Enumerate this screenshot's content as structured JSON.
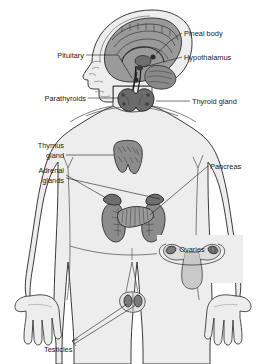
{
  "figure": {
    "title_partial": "",
    "width": 265,
    "height": 364
  },
  "colors": {
    "body_fill": "#ededed",
    "body_stroke": "#3a3a3a",
    "gland_fill": "#8c8c8c",
    "gland_stroke": "#2b2b2b",
    "brain_fill": "#9a9a9a",
    "brain_dark": "#5f5f5f",
    "label_text": "#1a1a1a",
    "leader_line": "#1a1a1a",
    "background": "#ffffff"
  },
  "labels": {
    "pineal_body": "Pineal body",
    "hypothalamus": "Hypothalamus",
    "pituitary": "Pituitary",
    "parathyroids": "Parathyroids",
    "thyroid_gland": "Thyroid gland",
    "thymus_gland_line1": "Thymus",
    "thymus_gland_line2": "gland",
    "adrenal_glands_line1": "Adrenal",
    "adrenal_glands_line2": "glands",
    "pancreas": "Pancreas",
    "ovaries": "Ovaries",
    "testicles": "Testicles"
  },
  "structures": [
    {
      "name": "pineal-body",
      "label": "Pineal body",
      "side": "right"
    },
    {
      "name": "hypothalamus",
      "label": "Hypothalamus",
      "side": "right"
    },
    {
      "name": "pituitary",
      "label": "Pituitary",
      "side": "left"
    },
    {
      "name": "parathyroids",
      "label": "Parathyroids",
      "side": "left"
    },
    {
      "name": "thyroid-gland",
      "label": "Thyroid gland",
      "side": "right"
    },
    {
      "name": "thymus-gland",
      "label": "Thymus gland",
      "side": "left"
    },
    {
      "name": "adrenal-glands",
      "label": "Adrenal glands",
      "side": "left"
    },
    {
      "name": "pancreas",
      "label": "Pancreas",
      "side": "right"
    },
    {
      "name": "ovaries",
      "label": "Ovaries",
      "side": "inset"
    },
    {
      "name": "testicles",
      "label": "Testicles",
      "side": "left"
    }
  ]
}
